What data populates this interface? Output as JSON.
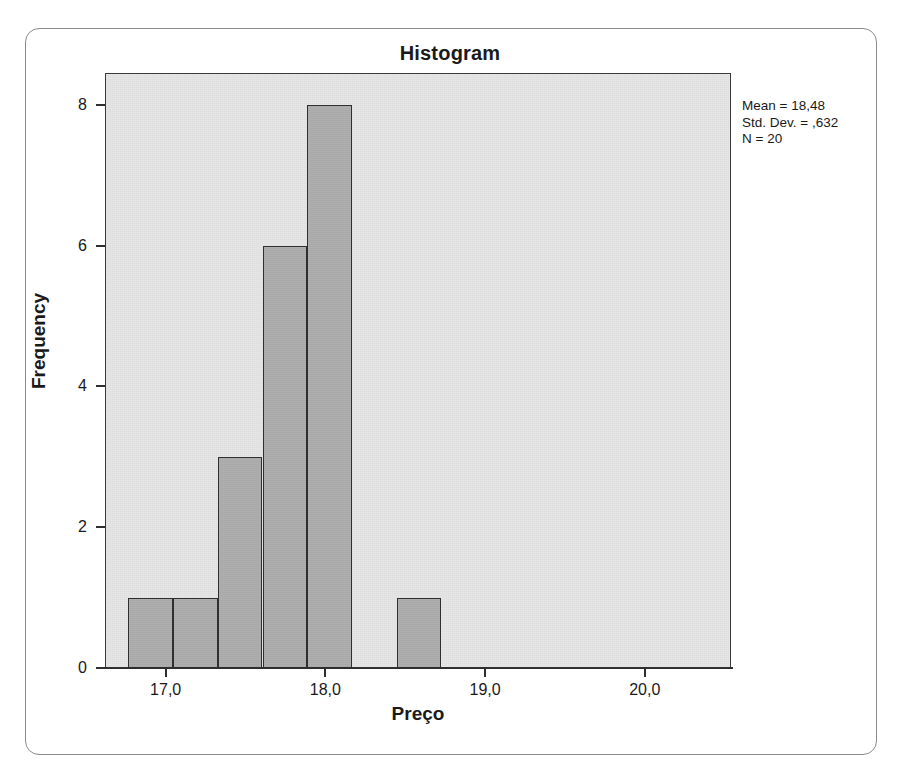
{
  "chart_data": {
    "type": "bar",
    "title": "Histogram",
    "xlabel": "Preço",
    "ylabel": "Frequency",
    "xlim": [
      16.62,
      20.54
    ],
    "ylim": [
      0,
      8.45
    ],
    "grid": false,
    "legend": null,
    "bin_width": 0.28,
    "x_ticks": [
      "17,0",
      "18,0",
      "19,0",
      "20,0"
    ],
    "x_tick_values": [
      17.0,
      18.0,
      19.0,
      20.0
    ],
    "y_ticks": [
      "0",
      "2",
      "4",
      "6",
      "8"
    ],
    "y_tick_values": [
      0,
      2,
      4,
      6,
      8
    ],
    "bin_centers": [
      16.9,
      17.18,
      17.46,
      17.74,
      18.02,
      18.3,
      18.58
    ],
    "bin_edges": [
      16.76,
      17.04,
      17.32,
      17.6,
      17.88,
      18.16,
      18.44,
      18.72
    ],
    "categories": [
      "16,8-17,1",
      "17,1-17,4",
      "17,4-17,7",
      "17,7-18,0",
      "18,0-18,3",
      "18,3-18,6",
      "18,6-18,9"
    ],
    "values": [
      1,
      1,
      3,
      6,
      8,
      0,
      1
    ],
    "bars": [
      {
        "label": "bin-1",
        "left": 16.76,
        "right": 17.04,
        "value": 1
      },
      {
        "label": "bin-2",
        "left": 17.04,
        "right": 17.32,
        "value": 1
      },
      {
        "label": "bin-3",
        "left": 17.32,
        "right": 17.6,
        "value": 3
      },
      {
        "label": "bin-4",
        "left": 17.6,
        "right": 17.88,
        "value": 6
      },
      {
        "label": "bin-5",
        "left": 17.88,
        "right": 18.16,
        "value": 8
      },
      {
        "label": "bin-6",
        "left": 18.16,
        "right": 18.44,
        "value": 0
      },
      {
        "label": "bin-7",
        "left": 18.44,
        "right": 18.72,
        "value": 1
      }
    ],
    "annotations": {
      "mean_label": "Mean = 18,48",
      "std_dev_label": "Std. Dev. = ,632",
      "n_label": "N = 20",
      "mean_value": 18.48,
      "std_dev_value": 0.632,
      "n_value": 20,
      "position": "top-right-outside"
    },
    "colors": {
      "bar_fill": "#adadad",
      "bar_border": "#2f2f2f",
      "plot_background": "#e7e7e7",
      "axis": "#2f2f2f",
      "text": "#1a1a1a",
      "frame_border": "#8b8b8b",
      "page_background": "#ffffff"
    }
  }
}
